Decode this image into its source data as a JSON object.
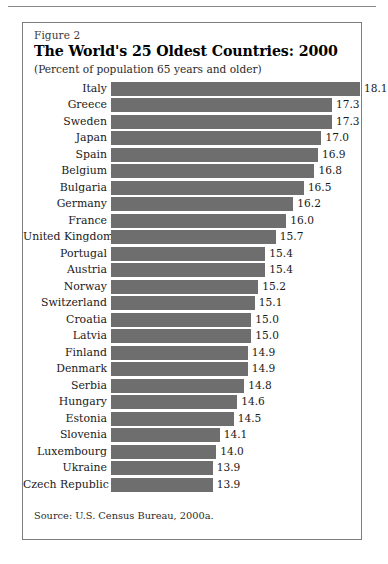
{
  "figure": {
    "label": "Figure 2",
    "title": "The World's 25 Oldest Countries:  2000",
    "subtitle": "(Percent of population 65 years and older)",
    "source": "Source: U.S. Census Bureau, 2000a."
  },
  "colors": {
    "bar": "#6e6e6e",
    "border": "#7d7d7d",
    "rule": "#8a8a8a",
    "text": "#1a1a1a",
    "background": "#ffffff"
  },
  "chart_data": {
    "type": "bar",
    "orientation": "horizontal",
    "title": "The World's 25 Oldest Countries:  2000",
    "subtitle": "(Percent of population 65 years and older)",
    "xlabel": "",
    "ylabel": "",
    "grid": false,
    "legend": "none",
    "axis_visible": false,
    "bar_baseline": 11.0,
    "xlim": [
      11.0,
      18.4
    ],
    "categories": [
      "Italy",
      "Greece",
      "Sweden",
      "Japan",
      "Spain",
      "Belgium",
      "Bulgaria",
      "Germany",
      "France",
      "United Kingdom",
      "Portugal",
      "Austria",
      "Norway",
      "Switzerland",
      "Croatia",
      "Latvia",
      "Finland",
      "Denmark",
      "Serbia",
      "Hungary",
      "Estonia",
      "Slovenia",
      "Luxembourg",
      "Ukraine",
      "Czech Republic"
    ],
    "values": [
      18.1,
      17.3,
      17.3,
      17.0,
      16.9,
      16.8,
      16.5,
      16.2,
      16.0,
      15.7,
      15.4,
      15.4,
      15.2,
      15.1,
      15.0,
      15.0,
      14.9,
      14.9,
      14.8,
      14.6,
      14.5,
      14.1,
      14.0,
      13.9,
      13.9
    ],
    "value_labels": [
      "18.1",
      "17.3",
      "17.3",
      "17.0",
      "16.9",
      "16.8",
      "16.5",
      "16.2",
      "16.0",
      "15.7",
      "15.4",
      "15.4",
      "15.2",
      "15.1",
      "15.0",
      "15.0",
      "14.9",
      "14.9",
      "14.8",
      "14.6",
      "14.5",
      "14.1",
      "14.0",
      "13.9",
      "13.9"
    ]
  }
}
